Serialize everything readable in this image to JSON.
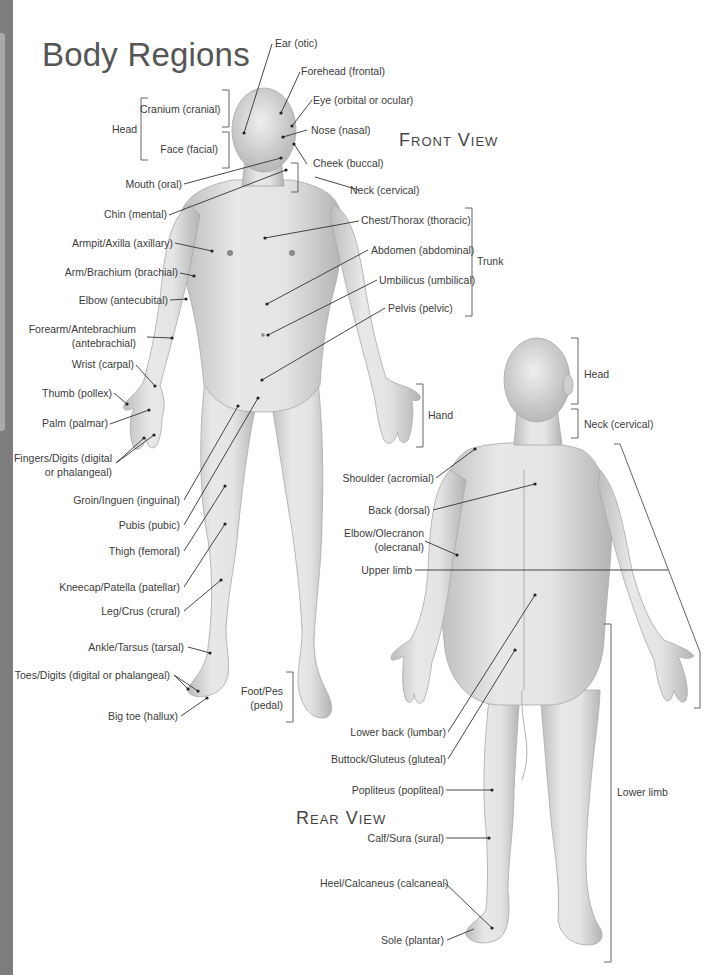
{
  "page": {
    "title": "Body Regions",
    "front_view_title": "Front View",
    "rear_view_title": "Rear View"
  },
  "front_labels": {
    "ear": "Ear (otic)",
    "forehead": "Forehead (frontal)",
    "eye": "Eye (orbital or ocular)",
    "nose": "Nose (nasal)",
    "cheek": "Cheek (buccal)",
    "neck": "Neck (cervical)",
    "head_group": "Head",
    "cranium": "Cranium (cranial)",
    "face": "Face (facial)",
    "mouth": "Mouth (oral)",
    "chin": "Chin (mental)",
    "armpit": "Armpit/Axilla (axillary)",
    "arm": "Arm/Brachium (brachial)",
    "elbow": "Elbow (antecubital)",
    "forearm_1": "Forearm/Antebrachium",
    "forearm_2": "(antebrachial)",
    "wrist": "Wrist (carpal)",
    "thumb": "Thumb (pollex)",
    "palm": "Palm (palmar)",
    "fingers_1": "Fingers/Digits (digital",
    "fingers_2": "or phalangeal)",
    "groin": "Groin/Inguen (inguinal)",
    "pubis": "Pubis (pubic)",
    "thigh": "Thigh (femoral)",
    "kneecap": "Kneecap/Patella (patellar)",
    "leg": "Leg/Crus (crural)",
    "ankle": "Ankle/Tarsus (tarsal)",
    "toes": "Toes/Digits (digital or phalangeal)",
    "big_toe": "Big toe (hallux)",
    "foot_1": "Foot/Pes",
    "foot_2": "(pedal)",
    "chest": "Chest/Thorax (thoracic)",
    "abdomen": "Abdomen (abdominal)",
    "umbilicus": "Umbilicus (umbilical)",
    "pelvis": "Pelvis (pelvic)",
    "trunk_group": "Trunk",
    "hand_group": "Hand"
  },
  "rear_labels": {
    "head_group": "Head",
    "neck": "Neck (cervical)",
    "shoulder": "Shoulder (acromial)",
    "back": "Back (dorsal)",
    "elbow_1": "Elbow/Olecranon",
    "elbow_2": "(olecranal)",
    "upper_limb": "Upper limb",
    "lower_back": "Lower back (lumbar)",
    "buttock": "Buttock/Gluteus (gluteal)",
    "popliteus": "Popliteus (popliteal)",
    "lower_limb": "Lower limb",
    "calf": "Calf/Sura (sural)",
    "heel": "Heel/Calcaneus (calcaneal)",
    "sole": "Sole (plantar)"
  },
  "colors": {
    "edge_band": "#7d7d7d",
    "skin_light": "#e6e6e6",
    "skin_shadow": "#b5b5b5",
    "leader_line": "#333333"
  }
}
